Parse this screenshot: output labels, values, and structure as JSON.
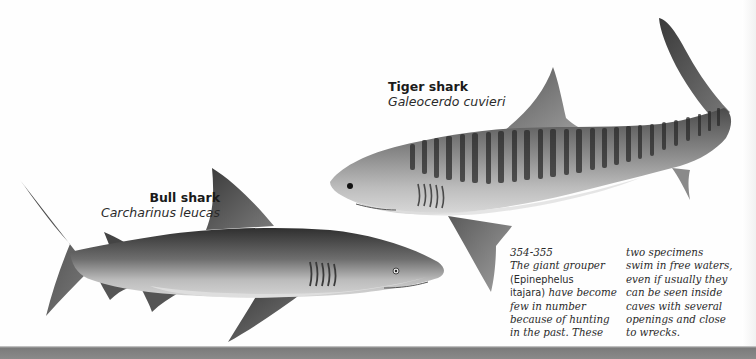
{
  "species": [
    {
      "common_name": "Tiger shark",
      "scientific_name": "Galeocerdo cuvieri"
    },
    {
      "common_name": "Bull shark",
      "scientific_name": "Carcharinus leucas"
    }
  ],
  "caption": {
    "reference": "354-355",
    "column_1": {
      "line_1": "The giant grouper",
      "line_2": "(Epinephelus",
      "line_3a": "itajara)",
      "line_3b": " have become",
      "line_4": "few in number",
      "line_5": "because of hunting",
      "line_6": "in the past. These"
    },
    "column_2": {
      "line_1": "two specimens",
      "line_2": "swim in free waters,",
      "line_3": "even if usually they",
      "line_4": "can be seen inside",
      "line_5": "caves with several",
      "line_6": "openings and close",
      "line_7": "to wrecks."
    }
  },
  "colors": {
    "page": "#fefefe",
    "text": "#1a1a1a",
    "shark_dark": "#2e2e2e",
    "shark_mid": "#7a7a7a",
    "shark_light": "#c9c9c9"
  }
}
